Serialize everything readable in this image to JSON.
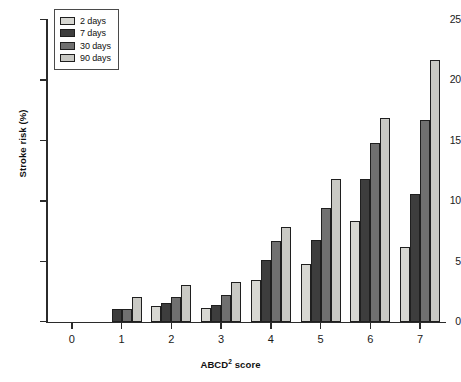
{
  "chart_data": {
    "type": "bar",
    "title": "",
    "subtitle": "",
    "xlabel": "ABCD² score",
    "xlabel_base": "ABCD",
    "xlabel_sup": "2",
    "xlabel_tail": " score",
    "ylabel": "Stroke risk (%)",
    "categories": [
      "0",
      "1",
      "2",
      "3",
      "4",
      "5",
      "6",
      "7"
    ],
    "xlim": [
      -0.5,
      7.5
    ],
    "ylim": [
      0,
      25
    ],
    "yticks": [
      0,
      5,
      10,
      15,
      20,
      25
    ],
    "ytick_labels": [
      "0",
      "5",
      "10",
      "15",
      "20",
      "25"
    ],
    "grid": false,
    "legend_position": "top-left",
    "series": [
      {
        "name": "2 days",
        "color": "#d7d7d2",
        "values": [
          0,
          0,
          1.3,
          1.2,
          3.5,
          4.8,
          8.4,
          6.2
        ]
      },
      {
        "name": "7 days",
        "color": "#3d3d3d",
        "values": [
          0,
          1.1,
          1.6,
          1.4,
          5.1,
          6.8,
          11.8,
          10.6
        ]
      },
      {
        "name": "30 days",
        "color": "#707070",
        "values": [
          0,
          1.1,
          2.1,
          2.2,
          6.7,
          9.4,
          14.8,
          16.7
        ]
      },
      {
        "name": "90 days",
        "color": "#c9c9c4",
        "values": [
          0,
          2.1,
          3.1,
          3.3,
          7.9,
          11.8,
          16.9,
          21.7
        ]
      }
    ]
  },
  "legend": {
    "items": [
      {
        "label": "2 days"
      },
      {
        "label": "7 days"
      },
      {
        "label": "30 days"
      },
      {
        "label": "90 days"
      }
    ]
  },
  "axes": {
    "y_title": "Stroke risk (%)",
    "x_title": "ABCD² score"
  }
}
